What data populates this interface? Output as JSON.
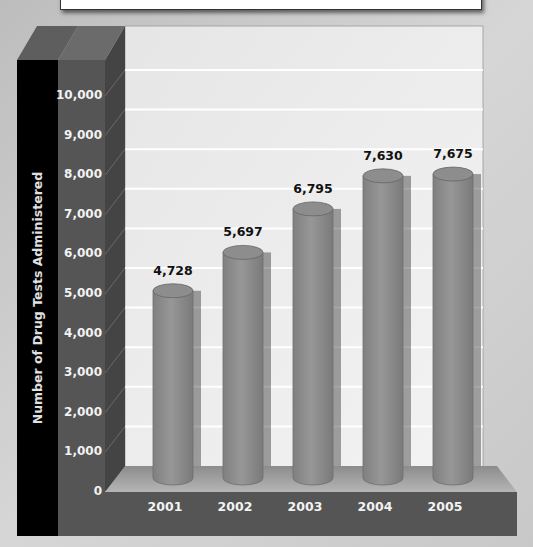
{
  "chart_data": {
    "type": "bar",
    "style": "3d-cylinder",
    "title": "",
    "xlabel": "",
    "ylabel": "Number of Drug Tests Administered",
    "categories": [
      "2001",
      "2002",
      "2003",
      "2004",
      "2005"
    ],
    "values": [
      4728,
      5697,
      6795,
      7630,
      7675
    ],
    "value_labels": [
      "4,728",
      "5,697",
      "6,795",
      "7,630",
      "7,675"
    ],
    "yticks": [
      "0",
      "1,000",
      "2,000",
      "3,000",
      "4,000",
      "5,000",
      "6,000",
      "7,000",
      "8,000",
      "9,000",
      "10,000"
    ],
    "ylim": [
      0,
      10000
    ],
    "grid": true,
    "legend": null
  },
  "colors": {
    "bar": "#8a8a8a",
    "back_wall": "#ebebeb",
    "axis_column": "#555555",
    "label_column": "#000000",
    "base": "#555555"
  }
}
